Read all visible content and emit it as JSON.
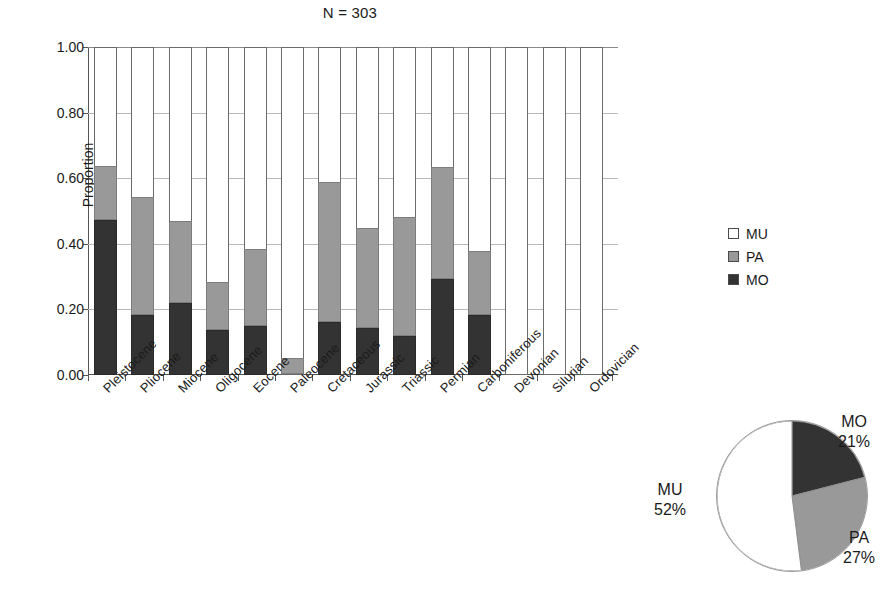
{
  "chart_data": {
    "type": "bar",
    "subtitle": "N = 303",
    "title": "",
    "xlabel": "",
    "ylabel": "Proportion",
    "ylim": [
      0,
      1
    ],
    "ytick_labels": [
      "0.00",
      "0.20",
      "0.40",
      "0.60",
      "0.80",
      "1.00"
    ],
    "ytick_values": [
      0,
      0.2,
      0.4,
      0.6,
      0.8,
      1.0
    ],
    "grid": true,
    "stacked": true,
    "normalized": true,
    "legend_position": "right",
    "categories": [
      "Pleistocene",
      "Pliocene",
      "Miocene",
      "Oligocene",
      "Eocene",
      "Paleocene",
      "Cretaceous",
      "Jurassic",
      "Triassic",
      "Permian",
      "Carboniferous",
      "Devonian",
      "Silurian",
      "Ordovician"
    ],
    "series": [
      {
        "name": "MO",
        "color": "#333333",
        "values": [
          0.47,
          0.18,
          0.215,
          0.135,
          0.145,
          0.0,
          0.16,
          0.14,
          0.115,
          0.29,
          0.18,
          0.0,
          0.0,
          0.0
        ]
      },
      {
        "name": "PA",
        "color": "#999999",
        "values": [
          0.165,
          0.36,
          0.25,
          0.145,
          0.235,
          0.05,
          0.425,
          0.305,
          0.365,
          0.34,
          0.195,
          0.0,
          0.0,
          0.0
        ]
      },
      {
        "name": "MU",
        "color": "#ffffff",
        "values": [
          0.365,
          0.46,
          0.535,
          0.72,
          0.62,
          0.95,
          0.415,
          0.555,
          0.52,
          0.37,
          0.625,
          1.0,
          1.0,
          1.0
        ]
      }
    ],
    "stack_tops": {
      "mo": [
        0.47,
        0.18,
        0.215,
        0.135,
        0.145,
        0.0,
        0.16,
        0.14,
        0.115,
        0.29,
        0.18,
        0.0,
        0.0,
        0.0
      ],
      "pa": [
        0.635,
        0.54,
        0.465,
        0.28,
        0.38,
        0.05,
        0.585,
        0.445,
        0.48,
        0.63,
        0.375,
        0.0,
        0.0,
        0.0
      ]
    }
  },
  "legend": {
    "items": [
      {
        "key": "mu",
        "label": "MU",
        "color": "#ffffff"
      },
      {
        "key": "pa",
        "label": "PA",
        "color": "#999999"
      },
      {
        "key": "mo",
        "label": "MO",
        "color": "#333333"
      }
    ]
  },
  "pie_data": {
    "type": "pie",
    "labels": [
      "MO",
      "PA",
      "MU"
    ],
    "values": [
      21,
      27,
      52
    ],
    "percent_labels": [
      "21%",
      "27%",
      "52%"
    ],
    "colors": [
      "#333333",
      "#999999",
      "#ffffff"
    ],
    "start_angle_deg": 0,
    "direction": "clockwise",
    "slices": [
      {
        "label": "MO",
        "percent_label": "21%",
        "value": 21,
        "color": "#333333"
      },
      {
        "label": "PA",
        "percent_label": "27%",
        "value": 27,
        "color": "#999999"
      },
      {
        "label": "MU",
        "percent_label": "52%",
        "value": 52,
        "color": "#ffffff"
      }
    ]
  }
}
